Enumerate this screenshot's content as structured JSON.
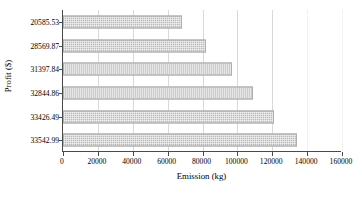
{
  "chart_data": {
    "type": "bar",
    "orientation": "horizontal",
    "title": "",
    "xlabel": "Emission (kg)",
    "ylabel": "Profit ($)",
    "categories": [
      "20585.53",
      "28569.87",
      "31397.84",
      "32844.86",
      "33426.49",
      "33542.99"
    ],
    "values": [
      68000,
      82000,
      97000,
      109000,
      121000,
      134000
    ],
    "xlim": [
      0,
      160000
    ],
    "xticks": [
      "0",
      "20000",
      "40000",
      "60000",
      "80000",
      "100000",
      "120000",
      "140000",
      "160000"
    ],
    "xtick_values": [
      0,
      20000,
      40000,
      60000,
      80000,
      100000,
      120000,
      140000,
      160000
    ],
    "grid": true,
    "grid_axis": "x",
    "legend": null,
    "bar_color": "#b9b9b9",
    "bar_pattern": "fine-dotted-hatch",
    "axis_color": "#4a4a4a",
    "gridline_color": "#d9d9d9",
    "background_color": "#ffffff"
  }
}
